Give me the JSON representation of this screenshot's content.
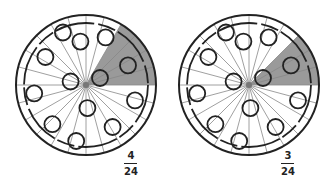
{
  "diagrams": [
    {
      "label": "pizza-left",
      "slices": 24,
      "shaded_slices": 4,
      "fraction": {
        "numerator": "4",
        "denominator": "24"
      }
    },
    {
      "label": "pizza-right",
      "slices": 24,
      "shaded_slices": 3,
      "fraction": {
        "numerator": "3",
        "denominator": "24"
      }
    }
  ],
  "colors": {
    "shade": "#9a9a9a",
    "line": "#222222",
    "spoke": "#888888"
  }
}
